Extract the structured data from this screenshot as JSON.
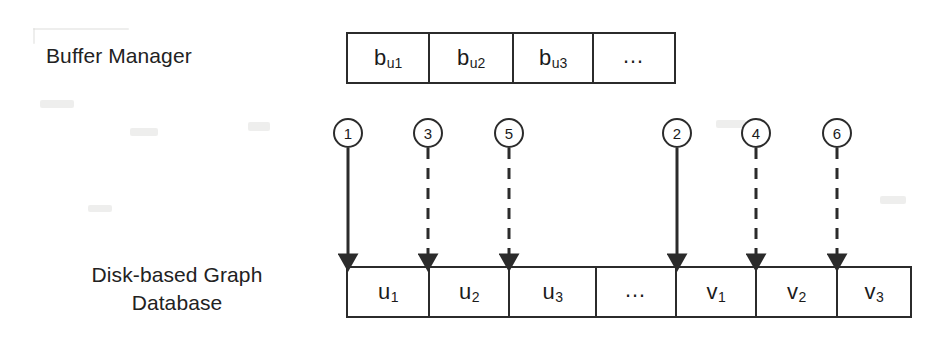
{
  "figure": {
    "background_color": "#ffffff",
    "line_color": "#2b2b2b",
    "text_color": "#1b1b1b"
  },
  "labels": {
    "buffer_manager": "Buffer Manager",
    "disk_database_line1": "Disk-based Graph",
    "disk_database_line2": "Database"
  },
  "buffer_row": {
    "name": "buffer-manager-cells",
    "cells": [
      {
        "base": "b",
        "sub": "u1",
        "text": "bu1",
        "width": 82
      },
      {
        "base": "b",
        "sub": "u2",
        "text": "bu2",
        "width": 84
      },
      {
        "base": "b",
        "sub": "u3",
        "text": "bu3",
        "width": 80
      },
      {
        "base": "…",
        "sub": "",
        "text": "…",
        "width": 80
      }
    ]
  },
  "disk_row": {
    "name": "disk-database-cells",
    "cells": [
      {
        "base": "u",
        "sub": "1",
        "text": "u1",
        "width": 82
      },
      {
        "base": "u",
        "sub": "2",
        "text": "u2",
        "width": 80
      },
      {
        "base": "u",
        "sub": "3",
        "text": "u3",
        "width": 87
      },
      {
        "base": "…",
        "sub": "",
        "text": "…",
        "width": 80
      },
      {
        "base": "v",
        "sub": "1",
        "text": "v1",
        "width": 80
      },
      {
        "base": "v",
        "sub": "2",
        "text": "v2",
        "width": 81
      },
      {
        "base": "v",
        "sub": "3",
        "text": "v3",
        "width": 72
      }
    ]
  },
  "steps": [
    {
      "number": "1",
      "style": "solid",
      "x": 348,
      "circle_top": 118,
      "line_top": 148,
      "line_bottom": 266
    },
    {
      "number": "3",
      "style": "dashed",
      "x": 428,
      "circle_top": 118,
      "line_top": 148,
      "line_bottom": 266
    },
    {
      "number": "5",
      "style": "dashed",
      "x": 509,
      "circle_top": 118,
      "line_top": 148,
      "line_bottom": 266
    },
    {
      "number": "2",
      "style": "solid",
      "x": 677,
      "circle_top": 118,
      "line_top": 148,
      "line_bottom": 266
    },
    {
      "number": "4",
      "style": "dashed",
      "x": 756,
      "circle_top": 118,
      "line_top": 148,
      "line_bottom": 266
    },
    {
      "number": "6",
      "style": "dashed",
      "x": 837,
      "circle_top": 118,
      "line_top": 148,
      "line_bottom": 266
    }
  ]
}
